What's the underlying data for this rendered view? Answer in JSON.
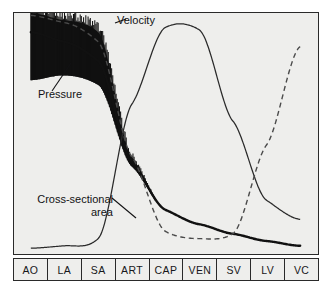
{
  "chart_data": {
    "type": "line",
    "title": "",
    "xlabel": "",
    "ylabel": "",
    "grid": false,
    "legend_position": "inline-annotations",
    "categories": [
      "AO",
      "LA",
      "SA",
      "ART",
      "CAP",
      "VEN",
      "SV",
      "LV",
      "VC"
    ],
    "category_full_names": {
      "AO": "Aorta",
      "LA": "Large arteries",
      "SA": "Small arteries",
      "ART": "Arterioles",
      "CAP": "Capillaries",
      "VEN": "Venules",
      "SV": "Small veins",
      "LV": "Large veins",
      "VC": "Vena cava"
    },
    "x": [
      0,
      1,
      2,
      3,
      4,
      5,
      6,
      7,
      8
    ],
    "ylim": [
      0,
      100
    ],
    "series": [
      {
        "name": "Pressure",
        "style": "solid-thick-with-pulsatile-band",
        "color": "#111111",
        "values": [
          92,
          88,
          80,
          38,
          18,
          12,
          8,
          5,
          3
        ],
        "band_upper": [
          100,
          97,
          92,
          40,
          18,
          12,
          8,
          5,
          3
        ],
        "band_lower": [
          72,
          74,
          70,
          36,
          18,
          12,
          8,
          5,
          3
        ],
        "note": "Pulsatile oscillation band damps out after small arteries"
      },
      {
        "name": "Velocity",
        "style": "dashed",
        "color": "#4a4a4a",
        "values": [
          99,
          96,
          88,
          40,
          9,
          6,
          8,
          45,
          86
        ]
      },
      {
        "name": "Cross-sectional area",
        "style": "solid-thin",
        "color": "#2a2a2a",
        "values": [
          2,
          3,
          6,
          62,
          94,
          93,
          55,
          22,
          14
        ]
      }
    ],
    "annotations": [
      {
        "id": "velocity",
        "label": "Velocity",
        "target_series": "Velocity"
      },
      {
        "id": "pressure",
        "label": "Pressure",
        "target_series": "Pressure"
      },
      {
        "id": "area",
        "label_line_1": "Cross-sectional",
        "label_line_2": "area",
        "target_series": "Cross-sectional area"
      }
    ]
  },
  "colors": {
    "plot_background": "#eeeeec",
    "frame": "#2a2a2a",
    "pressure": "#111111",
    "velocity": "#4a4a4a",
    "area": "#2a2a2a",
    "text": "#17171a"
  }
}
